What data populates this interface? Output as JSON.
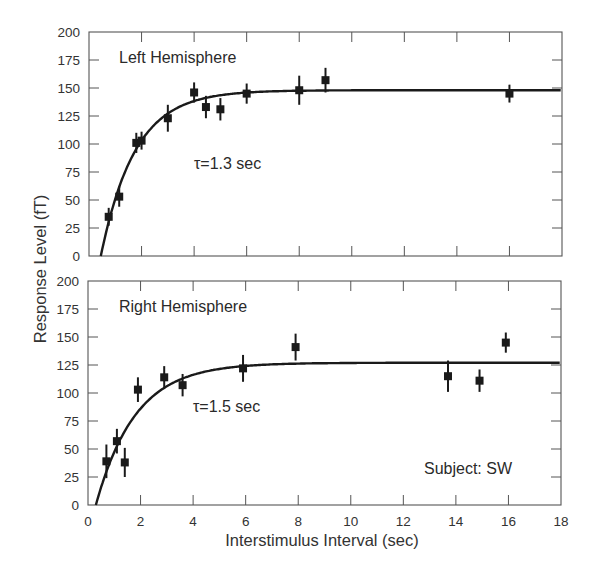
{
  "chart_data": [
    {
      "type": "scatter",
      "panel": "top",
      "title": "Left Hemisphere",
      "annotation": "τ=1.3 sec",
      "xlabel": "Interstimulus Interval (sec)",
      "ylabel": "Response Level (fT)",
      "xlim": [
        0,
        18
      ],
      "ylim": [
        0,
        200
      ],
      "yticks": [
        0,
        25,
        50,
        75,
        100,
        125,
        150,
        175,
        200
      ],
      "xticks": [
        0,
        2,
        4,
        6,
        8,
        10,
        12,
        14,
        16,
        18
      ],
      "grid": false,
      "series": [
        {
          "name": "measured",
          "marker": "square",
          "error_bars": true,
          "points": [
            {
              "x": 0.75,
              "y": 35,
              "err": 8
            },
            {
              "x": 1.15,
              "y": 53,
              "err": 9
            },
            {
              "x": 1.8,
              "y": 101,
              "err": 9
            },
            {
              "x": 2.0,
              "y": 103,
              "err": 8
            },
            {
              "x": 3.0,
              "y": 123,
              "err": 12
            },
            {
              "x": 4.0,
              "y": 146,
              "err": 9
            },
            {
              "x": 4.45,
              "y": 133,
              "err": 10
            },
            {
              "x": 5.0,
              "y": 131,
              "err": 10
            },
            {
              "x": 6.0,
              "y": 145,
              "err": 9
            },
            {
              "x": 8.0,
              "y": 148,
              "err": 13
            },
            {
              "x": 9.0,
              "y": 157,
              "err": 11
            },
            {
              "x": 16.0,
              "y": 145,
              "err": 8
            }
          ]
        },
        {
          "name": "exponential fit",
          "line": true,
          "asymptote": 148,
          "x0": 0.45,
          "tau": 1.3
        }
      ]
    },
    {
      "type": "scatter",
      "panel": "bottom",
      "title": "Right Hemisphere",
      "annotation": "τ=1.5 sec",
      "subject_label": "Subject: SW",
      "xlabel": "Interstimulus Interval (sec)",
      "ylabel": "Response Level (fT)",
      "xlim": [
        0,
        18
      ],
      "ylim": [
        0,
        200
      ],
      "yticks": [
        0,
        25,
        50,
        75,
        100,
        125,
        150,
        175,
        200
      ],
      "xticks": [
        0,
        2,
        4,
        6,
        8,
        10,
        12,
        14,
        16,
        18
      ],
      "grid": false,
      "series": [
        {
          "name": "measured",
          "marker": "square",
          "error_bars": true,
          "points": [
            {
              "x": 0.7,
              "y": 39,
              "err": 15
            },
            {
              "x": 1.1,
              "y": 57,
              "err": 11
            },
            {
              "x": 1.4,
              "y": 38,
              "err": 13
            },
            {
              "x": 1.9,
              "y": 103,
              "err": 11
            },
            {
              "x": 2.9,
              "y": 114,
              "err": 10
            },
            {
              "x": 3.6,
              "y": 107,
              "err": 10
            },
            {
              "x": 5.9,
              "y": 122,
              "err": 12
            },
            {
              "x": 7.9,
              "y": 141,
              "err": 12
            },
            {
              "x": 13.7,
              "y": 115,
              "err": 14
            },
            {
              "x": 14.9,
              "y": 111,
              "err": 10
            },
            {
              "x": 15.9,
              "y": 145,
              "err": 9
            }
          ]
        },
        {
          "name": "exponential fit",
          "line": true,
          "asymptote": 127,
          "x0": 0.3,
          "tau": 1.5
        }
      ]
    }
  ],
  "labels": {
    "ylabel": "Response Level (fT)",
    "xlabel": "Interstimulus Interval (sec)",
    "top_title": "Left Hemisphere",
    "top_tau": "τ=1.3 sec",
    "bottom_title": "Right Hemisphere",
    "bottom_tau": "τ=1.5 sec",
    "subject": "Subject: SW"
  }
}
